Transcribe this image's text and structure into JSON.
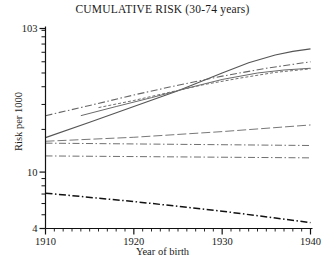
{
  "chart_data": {
    "type": "line",
    "title": "CUMULATIVE RISK (30-74 years)",
    "xlabel": "Year of birth",
    "ylabel": "Risk per 1000",
    "xlim": [
      1910,
      1940
    ],
    "ylim": [
      4,
      103
    ],
    "yscale": "log",
    "grid": false,
    "legend": "none",
    "xticks": [
      1910,
      1920,
      1930,
      1940
    ],
    "xtick_labels": [
      "1910",
      "1920",
      "1930",
      "1940"
    ],
    "xminor_step": 1,
    "yticks": [
      4,
      10,
      103
    ],
    "ytick_labels": [
      "4",
      "10",
      "103"
    ],
    "yminor_ticks": [
      5,
      6,
      7,
      8,
      9,
      20,
      30,
      40,
      50,
      60,
      70,
      80,
      90,
      100
    ],
    "series": [
      {
        "name": "series-1-solid-rising-top",
        "style": "solid",
        "color": "#555555",
        "width": 1.1,
        "x": [
          1910,
          1915,
          1920,
          1925,
          1930,
          1933,
          1936,
          1938,
          1940
        ],
        "y": [
          17.5,
          22.5,
          29.0,
          37.5,
          50.0,
          59.0,
          67.0,
          71.0,
          74.0
        ]
      },
      {
        "name": "series-2-dashdot-rising",
        "style": "dashdot",
        "color": "#666666",
        "width": 1.1,
        "x": [
          1910,
          1915,
          1920,
          1925,
          1930,
          1935,
          1940
        ],
        "y": [
          25.0,
          29.5,
          35.0,
          41.0,
          47.5,
          54.0,
          60.0
        ]
      },
      {
        "name": "series-3-solid-rising-mid",
        "style": "solid",
        "color": "#6a6a6a",
        "width": 1.0,
        "x": [
          1914,
          1918,
          1922,
          1926,
          1930,
          1934,
          1937,
          1940
        ],
        "y": [
          25.0,
          29.0,
          33.5,
          39.0,
          45.0,
          50.0,
          52.5,
          54.0
        ]
      },
      {
        "name": "series-4-shortdash-rising",
        "style": "shortdash",
        "color": "#6f6f6f",
        "width": 1.0,
        "x": [
          1916,
          1920,
          1924,
          1928,
          1932,
          1936,
          1940
        ],
        "y": [
          28.5,
          32.0,
          36.5,
          41.5,
          46.0,
          50.5,
          53.5
        ]
      },
      {
        "name": "series-5-longdash-slight-rise",
        "style": "longdash",
        "color": "#787878",
        "width": 1.0,
        "x": [
          1910,
          1920,
          1930,
          1940
        ],
        "y": [
          16.5,
          17.6,
          19.3,
          21.5
        ]
      },
      {
        "name": "series-6-dashdot-flat-upper",
        "style": "dashdot",
        "color": "#707070",
        "width": 1.0,
        "x": [
          1910,
          1940
        ],
        "y": [
          16.0,
          15.4
        ]
      },
      {
        "name": "series-7-dashdot-flat-lower",
        "style": "dashdot",
        "color": "#707070",
        "width": 1.0,
        "x": [
          1910,
          1940
        ],
        "y": [
          13.0,
          12.6
        ]
      },
      {
        "name": "series-8-dashdot-declining-bottom",
        "style": "dashdot",
        "color": "#111111",
        "width": 1.5,
        "x": [
          1910,
          1920,
          1930,
          1940
        ],
        "y": [
          7.1,
          6.2,
          5.3,
          4.4
        ]
      }
    ]
  }
}
